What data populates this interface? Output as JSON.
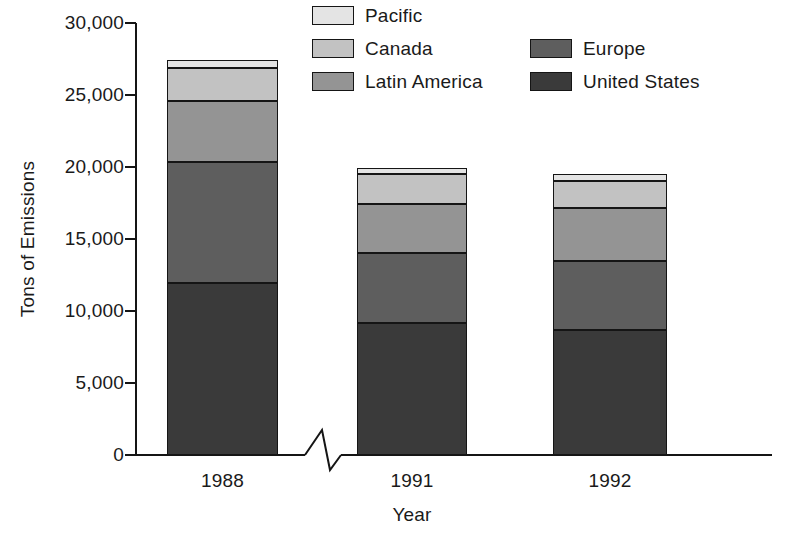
{
  "chart_data": {
    "type": "bar",
    "subtype": "stacked-vertical",
    "title": "",
    "xlabel": "Year",
    "ylabel": "Tons of Emissions",
    "categories": [
      "1988",
      "1991",
      "1992"
    ],
    "ylim": [
      0,
      30000
    ],
    "yticks": [
      0,
      5000,
      10000,
      15000,
      20000,
      25000,
      30000
    ],
    "ytick_labels": [
      "0",
      "5,000",
      "10,000",
      "15,000",
      "20,000",
      "25,000",
      "30,000"
    ],
    "grid": false,
    "legend_position": "top-right",
    "axis_break": "x-axis between 1988 and 1991",
    "stack_order_bottom_to_top": [
      "United States",
      "Europe",
      "Latin America",
      "Canada",
      "Pacific"
    ],
    "series": [
      {
        "name": "United States",
        "color": "#3a3a3a",
        "values": [
          11950,
          9150,
          8700
        ]
      },
      {
        "name": "Europe",
        "color": "#5e5e5e",
        "values": [
          8400,
          4850,
          4800
        ]
      },
      {
        "name": "Latin America",
        "color": "#949494",
        "values": [
          4250,
          3450,
          3650
        ]
      },
      {
        "name": "Canada",
        "color": "#c2c2c2",
        "values": [
          2250,
          2050,
          1900
        ]
      },
      {
        "name": "Pacific",
        "color": "#e4e4e4",
        "values": [
          600,
          400,
          450
        ]
      }
    ],
    "totals": [
      27450,
      19900,
      19500
    ],
    "annotations": []
  },
  "axes": {
    "y_title": "Tons of Emissions",
    "x_title": "Year",
    "y_ticks": [
      {
        "label": "30,000",
        "value": 30000
      },
      {
        "label": "25,000",
        "value": 25000
      },
      {
        "label": "20,000",
        "value": 20000
      },
      {
        "label": "15,000",
        "value": 15000
      },
      {
        "label": "10,000",
        "value": 10000
      },
      {
        "label": "5,000",
        "value": 5000
      },
      {
        "label": "0",
        "value": 0
      }
    ],
    "x_ticks": [
      "1988",
      "1991",
      "1992"
    ]
  },
  "legend": {
    "column_left": [
      {
        "label": "Pacific",
        "color": "#e4e4e4"
      },
      {
        "label": "Canada",
        "color": "#c2c2c2"
      },
      {
        "label": "Latin America",
        "color": "#949494"
      }
    ],
    "column_right": [
      {
        "label": "Europe",
        "color": "#5e5e5e"
      },
      {
        "label": "United States",
        "color": "#3a3a3a"
      }
    ]
  },
  "style": {
    "axis_color": "#151515",
    "background": "#ffffff",
    "text_color": "#1a1a1a"
  }
}
